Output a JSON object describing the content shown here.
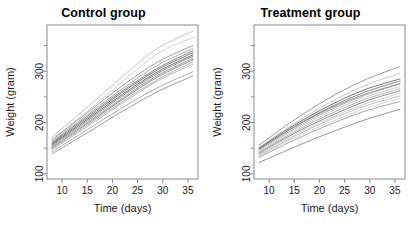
{
  "figure": {
    "background": "#ffffff",
    "panel_count": 2
  },
  "panels": [
    {
      "key": "control",
      "title": "Control group"
    },
    {
      "key": "treatment",
      "title": "Treatment group"
    }
  ],
  "axis": {
    "xlabel": "Time (days)",
    "ylabel": "Weight (gram)",
    "x_ticks": [
      10,
      15,
      20,
      25,
      30,
      35
    ],
    "y_ticks": [
      100,
      200,
      300
    ],
    "y_minor_ticks": [
      150,
      250,
      350
    ],
    "xlim": [
      7,
      37
    ],
    "ylim": [
      90,
      390
    ],
    "grid": false,
    "box": true,
    "tick_direction": "outward",
    "y_tick_label_rotation": -90,
    "axis_color": "#8a8a8a"
  },
  "chart_data": {
    "type": "line",
    "subtitle": "",
    "xlabel": "Time (days)",
    "ylabel": "Weight (gram)",
    "xlim": [
      7,
      37
    ],
    "ylim": [
      90,
      390
    ],
    "grid": false,
    "legend": "none",
    "x": [
      8,
      15,
      22,
      29,
      36
    ],
    "panels": [
      {
        "name": "Control group",
        "series": [
          {
            "name": "rat-c01",
            "color": "#b9b9b9",
            "values": [
              172,
              230,
              290,
              345,
              378
            ]
          },
          {
            "name": "rat-c02",
            "color": "#c6c6c6",
            "values": [
              168,
              222,
              280,
              334,
              366
            ]
          },
          {
            "name": "rat-c03",
            "color": "#8c8c8c",
            "values": [
              166,
              219,
              272,
              318,
              350
            ]
          },
          {
            "name": "rat-c04",
            "color": "#9a9a9a",
            "values": [
              163,
              215,
              266,
              312,
              344
            ]
          },
          {
            "name": "rat-c05",
            "color": "#707070",
            "values": [
              161,
              212,
              262,
              306,
              340
            ]
          },
          {
            "name": "rat-c06",
            "color": "#646464",
            "values": [
              159,
              209,
              259,
              303,
              336
            ]
          },
          {
            "name": "rat-c07",
            "color": "#555555",
            "values": [
              157,
              206,
              255,
              299,
              332
            ]
          },
          {
            "name": "rat-c08",
            "color": "#7d7d7d",
            "values": [
              155,
              203,
              252,
              296,
              329
            ]
          },
          {
            "name": "rat-c09",
            "color": "#8f8f8f",
            "values": [
              153,
              200,
              248,
              292,
              325
            ]
          },
          {
            "name": "rat-c10",
            "color": "#6b6b6b",
            "values": [
              151,
              198,
              245,
              289,
              322
            ]
          },
          {
            "name": "rat-c11",
            "color": "#a3a3a3",
            "values": [
              149,
              195,
              241,
              284,
              318
            ]
          },
          {
            "name": "rat-c12",
            "color": "#b0b0b0",
            "values": [
              147,
              192,
              238,
              281,
              314
            ]
          },
          {
            "name": "rat-c13",
            "color": "#c2c2c2",
            "values": [
              152,
              199,
              247,
              290,
              323
            ]
          },
          {
            "name": "rat-c14",
            "color": "#999999",
            "values": [
              143,
              186,
              229,
              268,
              299
            ]
          },
          {
            "name": "rat-c15",
            "color": "#8a8a8a",
            "values": [
              139,
              180,
              222,
              260,
              291
            ]
          }
        ]
      },
      {
        "name": "Treatment group",
        "series": [
          {
            "name": "rat-t01",
            "color": "#8a8a8a",
            "values": [
              156,
              205,
              248,
              283,
              309
            ]
          },
          {
            "name": "rat-t02",
            "color": "#bdbdbd",
            "values": [
              152,
              198,
              239,
              272,
              296
            ]
          },
          {
            "name": "rat-t03",
            "color": "#5a5a5a",
            "values": [
              150,
              195,
              233,
              264,
              285
            ]
          },
          {
            "name": "rat-t04",
            "color": "#6e6e6e",
            "values": [
              148,
              192,
              229,
              259,
              281
            ]
          },
          {
            "name": "rat-t05",
            "color": "#9d9d9d",
            "values": [
              146,
              188,
              224,
              253,
              275
            ]
          },
          {
            "name": "rat-t06",
            "color": "#c4c4c4",
            "values": [
              144,
              185,
              220,
              249,
              270
            ]
          },
          {
            "name": "rat-t07",
            "color": "#ababab",
            "values": [
              142,
              182,
              216,
              245,
              266
            ]
          },
          {
            "name": "rat-t08",
            "color": "#777777",
            "values": [
              140,
              179,
              212,
              241,
              262
            ]
          },
          {
            "name": "rat-t09",
            "color": "#c9c9c9",
            "values": [
              138,
              176,
              208,
              236,
              257
            ]
          },
          {
            "name": "rat-t10",
            "color": "#b4b4b4",
            "values": [
              136,
              173,
              205,
              232,
              252
            ]
          },
          {
            "name": "rat-t11",
            "color": "#868686",
            "values": [
              149,
              191,
              227,
              255,
              276
            ]
          },
          {
            "name": "rat-t12",
            "color": "#cfcfcf",
            "values": [
              134,
              170,
              200,
              227,
              247
            ]
          },
          {
            "name": "rat-t13",
            "color": "#969696",
            "values": [
              132,
              166,
              196,
              222,
              241
            ]
          },
          {
            "name": "rat-t14",
            "color": "#7f7f7f",
            "values": [
              122,
              152,
              180,
              205,
              226
            ]
          }
        ]
      }
    ]
  }
}
